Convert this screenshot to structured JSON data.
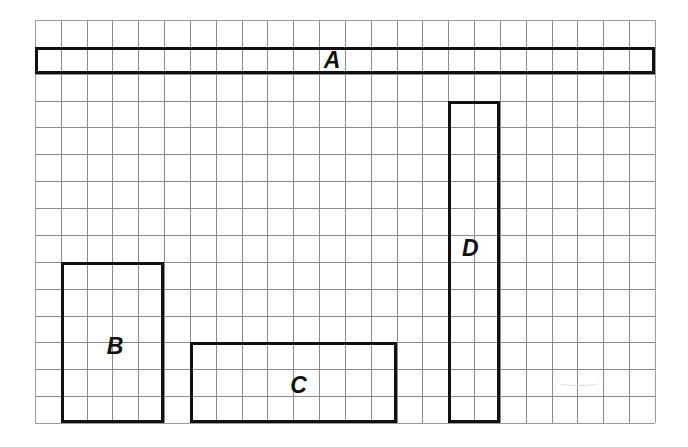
{
  "figure": {
    "background_color": "#ffffff",
    "grid": {
      "columns": 24,
      "rows": 15,
      "origin_x": 35,
      "origin_y": 20,
      "cell_width": 25.833,
      "cell_height": 26.867,
      "line_color": "#8c8c8c",
      "edge_color": "#9b9b9b",
      "line_width": 1
    },
    "shape_style": {
      "stroke_color": "#111111",
      "stroke_width": 3,
      "fill": "none"
    },
    "label_style": {
      "color": "#101010",
      "font_size": 23,
      "italic": true,
      "bold": true
    },
    "shapes": [
      {
        "label": "A",
        "col": 0,
        "row": 1,
        "width_cells": 24,
        "height_cells": 1,
        "label_col": 11.5,
        "label_row": 1.5,
        "label_size": 23
      },
      {
        "label": "B",
        "col": 1,
        "row": 9,
        "width_cells": 4,
        "height_cells": 6,
        "label_col": 3.1,
        "label_row": 12.15,
        "label_size": 23
      },
      {
        "label": "C",
        "col": 6,
        "row": 12,
        "width_cells": 8,
        "height_cells": 3,
        "label_col": 10.2,
        "label_row": 13.6,
        "label_size": 23
      },
      {
        "label": "D",
        "col": 16,
        "row": 3,
        "width_cells": 2,
        "height_cells": 12,
        "label_col": 16.85,
        "label_row": 8.5,
        "label_size": 23
      }
    ]
  }
}
